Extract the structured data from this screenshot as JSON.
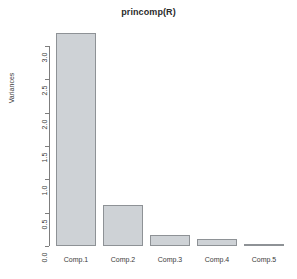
{
  "chart_data": {
    "type": "bar",
    "title": "princomp(R)",
    "xlabel": "",
    "ylabel": "Variances",
    "categories": [
      "Comp.1",
      "Comp.2",
      "Comp.3",
      "Comp.4",
      "Comp.5"
    ],
    "values": [
      3.2,
      0.62,
      0.16,
      0.11,
      0.03
    ],
    "ylim": [
      0.0,
      3.35
    ],
    "yticks": [
      "0.0",
      "0.5",
      "1.0",
      "1.5",
      "2.0",
      "2.5",
      "3.0"
    ],
    "ytick_values": [
      0.0,
      0.5,
      1.0,
      1.5,
      2.0,
      2.5,
      3.0
    ],
    "grid": false,
    "legend": null,
    "bar_fill_color": "#ced2d6",
    "bar_border_color": "#8e9296",
    "axis_color": "#7d7d7d",
    "background_color": "#ffffff",
    "text_color": "#3a3a3a"
  }
}
